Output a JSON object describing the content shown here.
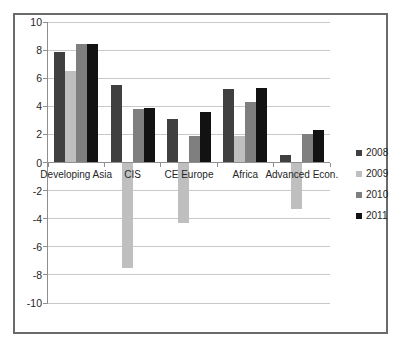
{
  "chart": {
    "background_color": "#ffffff",
    "frame_border_color": "#6a6a6a",
    "gridline_color": "#c9c9c9",
    "axis_color": "#8f8f8f",
    "text_color": "#262626"
  },
  "chart_data": {
    "type": "bar",
    "title": "",
    "xlabel": "",
    "ylabel": "",
    "categories": [
      "Developing Asia",
      "CIS",
      "CE Europe",
      "Africa",
      "Advanced Econ."
    ],
    "series": [
      {
        "name": "2008",
        "color": "#404040",
        "values": [
          7.9,
          5.5,
          3.1,
          5.2,
          0.5
        ]
      },
      {
        "name": "2009",
        "color": "#bfbfbf",
        "values": [
          6.5,
          -7.5,
          -4.3,
          1.9,
          -3.3
        ]
      },
      {
        "name": "2010",
        "color": "#7f7f7f",
        "values": [
          8.4,
          3.8,
          1.9,
          4.3,
          2.0
        ]
      },
      {
        "name": "2011",
        "color": "#121212",
        "values": [
          8.4,
          3.9,
          3.6,
          5.3,
          2.3
        ]
      }
    ],
    "ylim": [
      -10,
      10
    ],
    "y_tick_step": 2,
    "y_tick_labels": [
      "10",
      "8",
      "6",
      "4",
      "2",
      "0",
      "-2",
      "-4",
      "-6",
      "-8",
      "-10"
    ],
    "grid": "horizontal",
    "legend_position": "right"
  }
}
